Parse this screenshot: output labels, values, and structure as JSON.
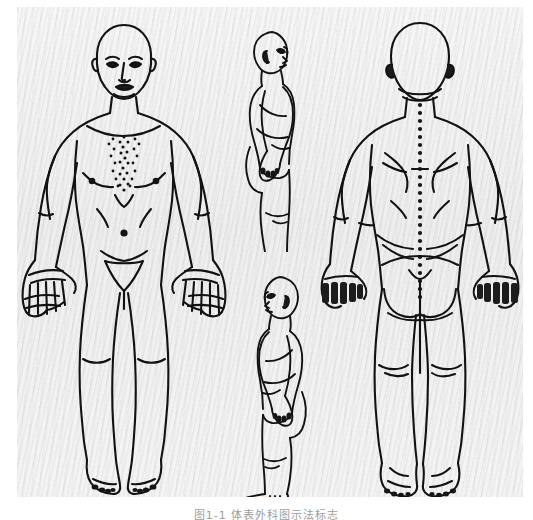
{
  "figure": {
    "kind": "anatomical-body-chart",
    "caption": "图1-1  体表外科图示法标志",
    "caption_visible": "partially cut off at bottom edge",
    "plate": {
      "background_color": "#f1f1f1",
      "ink_color": "#111111",
      "paper_color": "#ffffff",
      "texture": "diagonal scan moire"
    },
    "views": [
      {
        "id": "anterior",
        "label": "anterior-full-body-view",
        "position": "left",
        "details": [
          "head",
          "face",
          "neck",
          "chest with nipples",
          "sternum stipple line",
          "umbilicus dot",
          "pubic triangle",
          "arms",
          "open palms with fingers",
          "legs",
          "feet with toes"
        ]
      },
      {
        "id": "lateral-upper",
        "label": "lateral-view-facing-right",
        "position": "center-top",
        "details": [
          "head profile",
          "ear",
          "torso",
          "arm",
          "hand",
          "leg",
          "foot"
        ]
      },
      {
        "id": "lateral-lower",
        "label": "lateral-view-facing-left",
        "position": "center-bottom",
        "details": [
          "head profile",
          "ear",
          "torso",
          "arm",
          "hand",
          "leg",
          "foot"
        ]
      },
      {
        "id": "posterior",
        "label": "posterior-full-body-view",
        "position": "right",
        "details": [
          "back of head",
          "vertebral column dotted midline",
          "scapulae",
          "gluteal cleft",
          "buttocks",
          "arms",
          "dorsum of hands",
          "legs",
          "heels and soles"
        ]
      }
    ]
  }
}
